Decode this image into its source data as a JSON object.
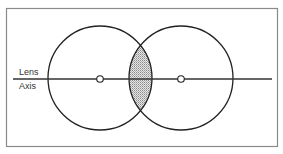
{
  "diagram": {
    "labels": {
      "top": "Lens",
      "bottom": "Axis"
    },
    "frame": {
      "x": 6,
      "y": 8,
      "width": 272,
      "height": 139,
      "color": "#888888"
    },
    "axis": {
      "x1": 13,
      "x2": 272,
      "y": 79,
      "color": "#333333"
    },
    "circles": [
      {
        "name": "left-circle",
        "cx": 100,
        "cy": 78,
        "r": 52
      },
      {
        "name": "right-circle",
        "cx": 181,
        "cy": 78,
        "r": 52
      }
    ],
    "centers": [
      {
        "name": "left-center",
        "cx": 100,
        "cy": 79,
        "r": 3.5
      },
      {
        "name": "right-center",
        "cx": 181,
        "cy": 79,
        "r": 3.5
      }
    ],
    "overlap": {
      "fill": "#cfcfcf",
      "description": "stippled lens-shaped intersection"
    },
    "stroke_color": "#222222"
  }
}
